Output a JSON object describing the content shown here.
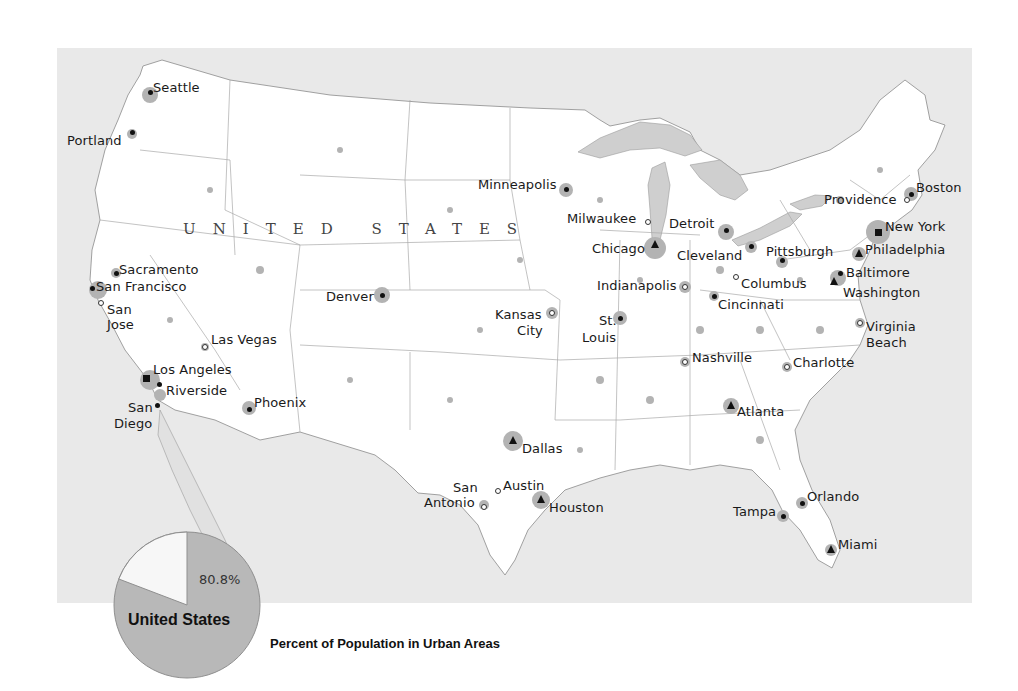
{
  "map": {
    "country_label": "UNITED STATES",
    "colors": {
      "ocean_and_foreign": "#e9e9e9",
      "us_land": "#ffffff",
      "urban_area": "#b3b3b3",
      "state_border": "#9a9a9a",
      "lakes": "#c8c8c8",
      "label_text": "#1a1a1a"
    },
    "symbol_legend": {
      "square": "largest metro (New York, Los Angeles)",
      "triangle": "major metro",
      "dot": "large city",
      "open-circle": "city"
    },
    "cities": [
      {
        "name": "Seattle",
        "symbol": "dot",
        "x": 150,
        "y": 92,
        "lx": 153,
        "ly": 81
      },
      {
        "name": "Portland",
        "symbol": "dot",
        "x": 132,
        "y": 132,
        "lx": 67,
        "ly": 134
      },
      {
        "name": "Sacramento",
        "symbol": "dot",
        "x": 116,
        "y": 273,
        "lx": 119,
        "ly": 263
      },
      {
        "name": "San Francisco",
        "symbol": "dot",
        "x": 92,
        "y": 288,
        "lx": 96,
        "ly": 280
      },
      {
        "name": "San",
        "symbol": "open-circle",
        "x": 101,
        "y": 303,
        "lx": 107,
        "ly": 303
      },
      {
        "name": "Jose",
        "symbol": "none",
        "x": 0,
        "y": 0,
        "lx": 107,
        "ly": 318
      },
      {
        "name": "Las Vegas",
        "symbol": "open-circle",
        "x": 205,
        "y": 347,
        "lx": 211,
        "ly": 333
      },
      {
        "name": "Los Angeles",
        "symbol": "square",
        "x": 146,
        "y": 378,
        "lx": 153,
        "ly": 363
      },
      {
        "name": "Riverside",
        "symbol": "dot",
        "x": 159,
        "y": 384,
        "lx": 166,
        "ly": 384
      },
      {
        "name": "San",
        "symbol": "dot",
        "x": 157,
        "y": 405,
        "lx": 128,
        "ly": 401
      },
      {
        "name": "Diego",
        "symbol": "none",
        "x": 0,
        "y": 0,
        "lx": 114,
        "ly": 417
      },
      {
        "name": "Phoenix",
        "symbol": "dot",
        "x": 249,
        "y": 409,
        "lx": 254,
        "ly": 396
      },
      {
        "name": "Denver",
        "symbol": "dot",
        "x": 382,
        "y": 295,
        "lx": 326,
        "ly": 290
      },
      {
        "name": "Minneapolis",
        "symbol": "dot",
        "x": 566,
        "y": 189,
        "lx": 478,
        "ly": 178
      },
      {
        "name": "Milwaukee",
        "symbol": "open-circle",
        "x": 648,
        "y": 222,
        "lx": 567,
        "ly": 212
      },
      {
        "name": "Chicago",
        "symbol": "triangle",
        "x": 655,
        "y": 245,
        "lx": 592,
        "ly": 242
      },
      {
        "name": "Detroit",
        "symbol": "dot",
        "x": 726,
        "y": 230,
        "lx": 669,
        "ly": 217
      },
      {
        "name": "Cleveland",
        "symbol": "dot",
        "x": 751,
        "y": 246,
        "lx": 677,
        "ly": 249
      },
      {
        "name": "Pittsburgh",
        "symbol": "dot",
        "x": 782,
        "y": 260,
        "lx": 766,
        "ly": 245
      },
      {
        "name": "Indianapolis",
        "symbol": "open-circle",
        "x": 685,
        "y": 287,
        "lx": 597,
        "ly": 279
      },
      {
        "name": "Columbus",
        "symbol": "open-circle",
        "x": 736,
        "y": 277,
        "lx": 741,
        "ly": 277
      },
      {
        "name": "Cincinnati",
        "symbol": "dot",
        "x": 714,
        "y": 296,
        "lx": 718,
        "ly": 298
      },
      {
        "name": "Kansas",
        "symbol": "open-circle",
        "x": 552,
        "y": 313,
        "lx": 495,
        "ly": 308
      },
      {
        "name": "City",
        "symbol": "none",
        "x": 0,
        "y": 0,
        "lx": 517,
        "ly": 324
      },
      {
        "name": "St.",
        "symbol": "dot",
        "x": 620,
        "y": 318,
        "lx": 599,
        "ly": 314
      },
      {
        "name": "Louis",
        "symbol": "none",
        "x": 0,
        "y": 0,
        "lx": 582,
        "ly": 331
      },
      {
        "name": "Nashville",
        "symbol": "open-circle",
        "x": 685,
        "y": 362,
        "lx": 692,
        "ly": 351
      },
      {
        "name": "Charlotte",
        "symbol": "open-circle",
        "x": 787,
        "y": 367,
        "lx": 793,
        "ly": 356
      },
      {
        "name": "Atlanta",
        "symbol": "triangle",
        "x": 731,
        "y": 406,
        "lx": 737,
        "ly": 405
      },
      {
        "name": "Boston",
        "symbol": "dot",
        "x": 911,
        "y": 194,
        "lx": 916,
        "ly": 181
      },
      {
        "name": "Providence",
        "symbol": "open-circle",
        "x": 907,
        "y": 200,
        "lx": 824,
        "ly": 193
      },
      {
        "name": "New York",
        "symbol": "square",
        "x": 878,
        "y": 232,
        "lx": 885,
        "ly": 220
      },
      {
        "name": "Philadelphia",
        "symbol": "triangle",
        "x": 859,
        "y": 254,
        "lx": 865,
        "ly": 243
      },
      {
        "name": "Baltimore",
        "symbol": "dot",
        "x": 840,
        "y": 273,
        "lx": 846,
        "ly": 266
      },
      {
        "name": "Washington",
        "symbol": "triangle",
        "x": 834,
        "y": 282,
        "lx": 843,
        "ly": 286
      },
      {
        "name": "Virginia",
        "symbol": "open-circle",
        "x": 860,
        "y": 323,
        "lx": 866,
        "ly": 320
      },
      {
        "name": "Beach",
        "symbol": "none",
        "x": 0,
        "y": 0,
        "lx": 866,
        "ly": 336
      },
      {
        "name": "Dallas",
        "symbol": "triangle",
        "x": 513,
        "y": 441,
        "lx": 522,
        "ly": 442
      },
      {
        "name": "Austin",
        "symbol": "open-circle",
        "x": 498,
        "y": 491,
        "lx": 503,
        "ly": 479
      },
      {
        "name": "San",
        "symbol": "open-circle",
        "x": 484,
        "y": 507,
        "lx": 453,
        "ly": 481
      },
      {
        "name": "Antonio",
        "symbol": "none",
        "x": 0,
        "y": 0,
        "lx": 424,
        "ly": 496
      },
      {
        "name": "Houston",
        "symbol": "triangle",
        "x": 541,
        "y": 500,
        "lx": 549,
        "ly": 501
      },
      {
        "name": "Orlando",
        "symbol": "dot",
        "x": 802,
        "y": 503,
        "lx": 807,
        "ly": 490
      },
      {
        "name": "Tampa",
        "symbol": "dot",
        "x": 783,
        "y": 516,
        "lx": 733,
        "ly": 505
      },
      {
        "name": "Miami",
        "symbol": "triangle",
        "x": 831,
        "y": 550,
        "lx": 838,
        "ly": 538
      }
    ]
  },
  "chart_data": {
    "type": "pie",
    "title": "Percent of Population in Urban Areas",
    "label": "United States",
    "categories": [
      "Urban",
      "Non-urban"
    ],
    "values": [
      80.8,
      19.2
    ],
    "value_labels": [
      "80.8%",
      ""
    ],
    "colors": [
      "#b8b8b8",
      "#f7f7f7"
    ]
  },
  "legend": {
    "title": "Percent of Population in Urban Areas",
    "pie_label": "United States",
    "pie_value": "80.8%"
  }
}
